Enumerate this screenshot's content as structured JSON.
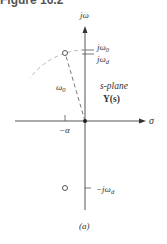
{
  "header": {
    "title": "Figure 16.2"
  },
  "diagram": {
    "caption": "(a)",
    "plane_label": "s-plane",
    "function_label": "Y(s)",
    "axes": {
      "vertical_label": "jω",
      "horizontal_label": "σ"
    },
    "tick_labels": {
      "j_omega_0": {
        "base": "jω",
        "sub": "0"
      },
      "j_omega_d": {
        "base": "jω",
        "sub": "d"
      },
      "neg_j_omega_d": {
        "base": "−jω",
        "sub": "d"
      },
      "neg_alpha": "−α"
    },
    "radius_label": {
      "base": "ω",
      "sub": "0"
    },
    "markers": [
      {
        "type": "zero-circle",
        "position": "upper",
        "label": "α + jω_d"
      },
      {
        "type": "zero-circle",
        "position": "lower",
        "label": "α − jω_d"
      },
      {
        "type": "origin-dot"
      }
    ],
    "colors": {
      "axis": "#555555",
      "dashed": "#aaaaaa",
      "text": "#333333"
    }
  }
}
